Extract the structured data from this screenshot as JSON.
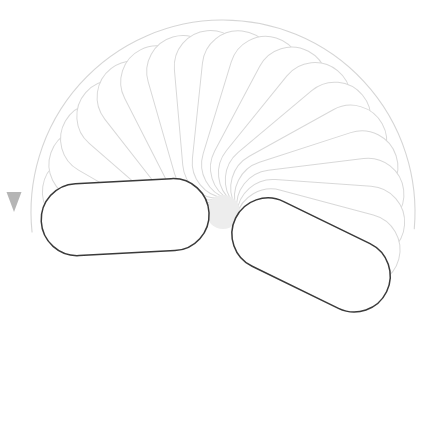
{
  "canvas": {
    "width": 426,
    "height": 430,
    "background": "#ffffff",
    "label": "rotation-onion-skin-canvas"
  },
  "colors": {
    "active_stroke": "#3a3a3a",
    "ghost_stroke": "#d9d9d9",
    "ghost_stroke_faint": "#e2e2e2",
    "pivot_fill": "#ededed",
    "motion_arc": "#d6d6d6",
    "arrow_fill": "#b5b5b5",
    "shape_fill": "#ffffff"
  },
  "pivot": {
    "name": "rotation-pivot",
    "cx": 223,
    "cy": 212,
    "r": 17,
    "fill": "#ededed"
  },
  "motion_path": {
    "name": "rotation-direction-arc",
    "cx": 223,
    "cy": 212,
    "radius": 192,
    "start_angle_deg": -5,
    "end_angle_deg": 186,
    "direction": "counter-clockwise",
    "stroke": "#d6d6d6",
    "stroke_width": 1.1
  },
  "direction_arrow": {
    "name": "rotation-direction-arrow",
    "tip_x": 14,
    "tip_y": 212,
    "width": 15,
    "height": 20,
    "fill": "#b5b5b5",
    "points": "6.5,192 21.5,192 14,212"
  },
  "capsule": {
    "length": 168,
    "thickness": 72,
    "corner_radius": 36,
    "pivot_offset": 14,
    "fill": "#ffffff"
  },
  "frames": [
    {
      "index": 0,
      "angle": 183,
      "state": "active",
      "stroke": "#3a3a3a",
      "stroke_width": 1.5,
      "opacity": 1
    },
    {
      "index": 1,
      "angle": 172,
      "state": "ghost",
      "stroke": "#d9d9d9",
      "stroke_width": 1,
      "opacity": 1
    },
    {
      "index": 2,
      "angle": 161,
      "state": "ghost",
      "stroke": "#d9d9d9",
      "stroke_width": 1,
      "opacity": 1
    },
    {
      "index": 3,
      "angle": 150,
      "state": "ghost",
      "stroke": "#d9d9d9",
      "stroke_width": 1,
      "opacity": 1
    },
    {
      "index": 4,
      "angle": 139,
      "state": "ghost",
      "stroke": "#d9d9d9",
      "stroke_width": 1,
      "opacity": 1
    },
    {
      "index": 5,
      "angle": 128,
      "state": "ghost",
      "stroke": "#d9d9d9",
      "stroke_width": 1,
      "opacity": 1
    },
    {
      "index": 6,
      "angle": 117,
      "state": "ghost",
      "stroke": "#d9d9d9",
      "stroke_width": 1,
      "opacity": 1
    },
    {
      "index": 7,
      "angle": 106,
      "state": "ghost",
      "stroke": "#d9d9d9",
      "stroke_width": 1,
      "opacity": 1
    },
    {
      "index": 8,
      "angle": 95,
      "state": "ghost",
      "stroke": "#d9d9d9",
      "stroke_width": 1,
      "opacity": 1
    },
    {
      "index": 9,
      "angle": 84,
      "state": "ghost",
      "stroke": "#d9d9d9",
      "stroke_width": 1,
      "opacity": 1
    },
    {
      "index": 10,
      "angle": 73,
      "state": "ghost",
      "stroke": "#d9d9d9",
      "stroke_width": 1,
      "opacity": 1
    },
    {
      "index": 11,
      "angle": 62,
      "state": "ghost",
      "stroke": "#d9d9d9",
      "stroke_width": 1,
      "opacity": 1
    },
    {
      "index": 12,
      "angle": 51,
      "state": "ghost",
      "stroke": "#d9d9d9",
      "stroke_width": 1,
      "opacity": 1
    },
    {
      "index": 13,
      "angle": 40,
      "state": "ghost",
      "stroke": "#d9d9d9",
      "stroke_width": 1,
      "opacity": 1
    },
    {
      "index": 14,
      "angle": 29,
      "state": "ghost",
      "stroke": "#d9d9d9",
      "stroke_width": 1,
      "opacity": 1
    },
    {
      "index": 15,
      "angle": 18,
      "state": "ghost",
      "stroke": "#d9d9d9",
      "stroke_width": 1,
      "opacity": 1
    },
    {
      "index": 16,
      "angle": 7,
      "state": "ghost",
      "stroke": "#d9d9d9",
      "stroke_width": 1,
      "opacity": 1
    },
    {
      "index": 17,
      "angle": -4,
      "state": "ghost",
      "stroke": "#d9d9d9",
      "stroke_width": 1,
      "opacity": 1
    },
    {
      "index": 18,
      "angle": -15,
      "state": "ghost",
      "stroke": "#d9d9d9",
      "stroke_width": 1,
      "opacity": 1
    },
    {
      "index": 19,
      "angle": -26,
      "state": "current",
      "stroke": "#3a3a3a",
      "stroke_width": 1.5,
      "opacity": 1
    }
  ]
}
